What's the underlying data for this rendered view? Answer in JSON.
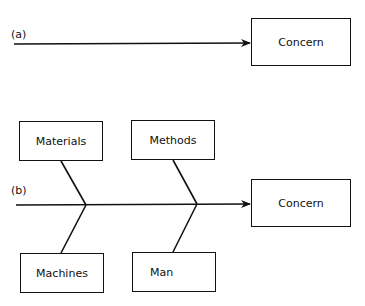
{
  "diagram_a": {
    "label": "(a)",
    "effect": "Concern"
  },
  "diagram_b": {
    "label": "(b)",
    "effect": "Concern",
    "causes_top": [
      "Materials",
      "Methods"
    ],
    "causes_bottom": [
      "Machines",
      "Man"
    ]
  },
  "colors": {
    "stroke": "#111111",
    "background": "#ffffff"
  }
}
